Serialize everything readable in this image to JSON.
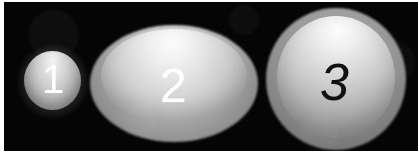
{
  "scene": {
    "width": 418,
    "height": 160,
    "background_color": "#ffffff",
    "plate_color": "#050505",
    "description": "Three grayscale rounded objects on a black background, labelled 1, 2 and 3"
  },
  "objects": [
    {
      "id": "object-1",
      "label": "1",
      "shape": "circle",
      "label_color": "#ffffff",
      "label_style": "upright",
      "fill_light": "#f4f4f4",
      "fill_dark": "#787878",
      "halo_color": "#787878",
      "cx": 48,
      "cy": 78,
      "rx": 28,
      "ry": 29
    },
    {
      "id": "object-2",
      "label": "2",
      "shape": "ellipse",
      "label_color": "#ffffff",
      "label_style": "upright",
      "fill_light": "#fbfbfb",
      "fill_dark": "#9a9a9a",
      "halo_color": "#6f6f6f",
      "cx": 170,
      "cy": 81,
      "rx": 84,
      "ry": 58
    },
    {
      "id": "object-3",
      "label": "3",
      "shape": "circle",
      "label_color": "#111111",
      "label_style": "italic",
      "fill_light": "#fcfcfc",
      "fill_dark": "#8c8c8c",
      "halo_color": "#6c6c6c",
      "cx": 332,
      "cy": 77,
      "rx": 70,
      "ry": 71
    }
  ]
}
